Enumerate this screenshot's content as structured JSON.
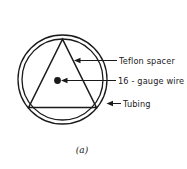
{
  "figure": {
    "caption": "(a)",
    "title": "",
    "colors": {
      "ink": "#1a1a1a",
      "background": "#ffffff"
    },
    "labels": [
      {
        "id": "teflon-spacer",
        "text": "Teflon spacer",
        "points_to": "triangle-edge"
      },
      {
        "id": "wire",
        "text": "16 - gauge wire",
        "points_to": "center-dot"
      },
      {
        "id": "tubing",
        "text": "Tubing",
        "points_to": "outer-circle"
      }
    ],
    "shapes": {
      "outer_circle": "tubing-outer-wall",
      "inner_circle": "tubing-inner-wall",
      "triangle": "teflon-spacer",
      "dot": "16-gauge-wire"
    }
  }
}
